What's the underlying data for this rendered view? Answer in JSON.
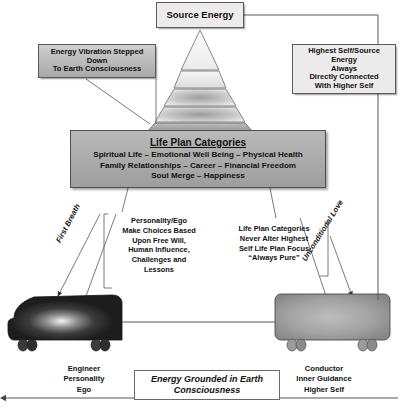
{
  "diagram": {
    "title_box": {
      "label": "Source Energy"
    },
    "left_callout": {
      "line1": "Energy Vibration Stepped",
      "line2": "Down",
      "line3": "To Earth Consciousness"
    },
    "right_callout": {
      "line1": "Highest Self/Source Energy",
      "line2": "Always",
      "line3": "Directly Connected",
      "line4": "With Higher Self"
    },
    "life_plan": {
      "title": "Life Plan Categories",
      "line1": "Spiritual Life – Emotional Well Being – Physical Health",
      "line2": "Family Relationships – Career – Financial Freedom",
      "line3": "Soul Merge – Happiness"
    },
    "personality_annotation": {
      "line1": "Personality/Ego",
      "line2": "Make Choices Based",
      "line3": "Upon Free Will,",
      "line4": "Human Influence,",
      "line5": "Challenges and",
      "line6": "Lessons"
    },
    "lifeplan_annotation": {
      "line1": "Life Plan Categories",
      "line2": "Never Alter Highest",
      "line3": "Self Life Plan Focus",
      "line4": "“Always Pure”"
    },
    "rotated_labels": {
      "left": "First Breath",
      "right": "Unconditional Love"
    },
    "engineer_caption": {
      "line1": "Engineer",
      "line2": "Personality",
      "line3": "Ego"
    },
    "conductor_caption": {
      "line1": "Conductor",
      "line2": "Inner Guidance",
      "line3": "Higher Self"
    },
    "grounded_box": {
      "line1": "Energy Grounded in Earth",
      "line2": "Consciousness"
    },
    "pyramid": {
      "name": "stepped-down-energy-pyramid",
      "band_count": 5
    },
    "colors": {
      "box_fill": "#eceaea",
      "gradient_dark": "#a9a9a9",
      "life_plan_fill": "#ababab",
      "engineer_vehicle": "#2b2b2b",
      "conductor_vehicle": "#9e9e9e",
      "line": "#5a5a5a"
    }
  }
}
